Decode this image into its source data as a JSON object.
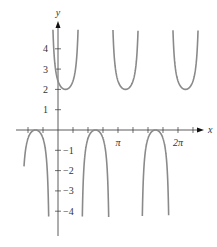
{
  "chart_data": {
    "type": "line",
    "title": "",
    "function": "y = 1 + csc(2x + π/4)",
    "xlabel": "x",
    "ylabel": "y",
    "xlim": [
      -1.75,
      6.9
    ],
    "ylim": [
      -5.2,
      5.4
    ],
    "x_ticks": [
      {
        "value": 3.14159,
        "label": "π"
      },
      {
        "value": 6.28319,
        "label": "2π"
      }
    ],
    "x_minor_tick_step": 0.785398,
    "y_ticks": [
      {
        "value": 4,
        "label": "4"
      },
      {
        "value": 3,
        "label": "3"
      },
      {
        "value": 2,
        "label": "2"
      },
      {
        "value": 1,
        "label": "1"
      },
      {
        "value": -1,
        "label": "−1"
      },
      {
        "value": -2,
        "label": "−2"
      },
      {
        "value": -3,
        "label": "−3"
      },
      {
        "value": -4,
        "label": "−4"
      }
    ],
    "grid": false,
    "clip_y": [
      -4.3,
      4.95
    ],
    "line_color": "#8a8a8a",
    "axis_color": "#333333",
    "features": {
      "period": 3.14159,
      "upper_branch_minimum": 2,
      "lower_branch_maximum": 0,
      "vertical_asymptotes": [
        -1.963,
        -0.393,
        1.178,
        2.749,
        4.32,
        5.89
      ]
    }
  },
  "pixel_map": {
    "origin_x": 58,
    "origin_y": 130,
    "px_per_pi": 60,
    "px_per_unit_y": 20.3
  }
}
